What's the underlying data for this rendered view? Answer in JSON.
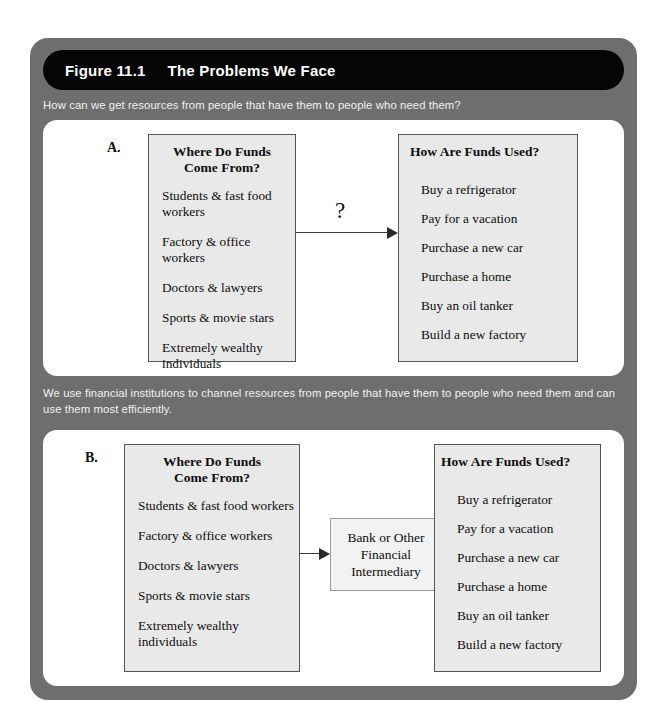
{
  "figure": {
    "number": "Figure 11.1",
    "title": "The Problems We Face",
    "caption_a": "How can we get resources from people that have them to people who need them?",
    "caption_b": "We use financial institutions to channel resources from people that have them to people who need them and can use them most efficiently."
  },
  "colors": {
    "frame": "#6e6e6e",
    "title_bar": "#050505",
    "title_text": "#ffffff",
    "caption_text": "#f2f2f2",
    "panel_card": "#ffffff",
    "content_box": "#e9e9e9",
    "content_box_border": "#55555a",
    "middle_box": "#f2f2f2",
    "arrow": "#2b2b2b",
    "body_text": "#0d0d0d"
  },
  "panel_a": {
    "letter": "A.",
    "sources": {
      "heading": "Where Do Funds\nCome From?",
      "heading_line1": "Where Do Funds",
      "heading_line2": "Come From?",
      "items": [
        "Students & fast food workers",
        "Factory & office workers",
        "Doctors & lawyers",
        "Sports & movie stars",
        "Extremely wealthy individuals"
      ]
    },
    "uses": {
      "heading": "How Are Funds Used?",
      "items": [
        "Buy a refrigerator",
        "Pay for a vacation",
        "Purchase a new car",
        "Purchase a home",
        "Buy an oil tanker",
        "Build a new factory"
      ]
    },
    "connector_label": "?"
  },
  "panel_b": {
    "letter": "B.",
    "sources": {
      "heading_line1": "Where Do Funds",
      "heading_line2": "Come From?",
      "items": [
        "Students & fast food workers",
        "Factory & office workers",
        "Doctors & lawyers",
        "Sports & movie stars",
        "Extremely wealthy individuals"
      ]
    },
    "intermediary": {
      "text": "Bank or Other\nFinancial\nIntermediary"
    },
    "uses": {
      "heading": "How Are Funds Used?",
      "items": [
        "Buy a refrigerator",
        "Pay for a vacation",
        "Purchase a new car",
        "Purchase a home",
        "Buy an oil tanker",
        "Build a new factory"
      ]
    }
  }
}
